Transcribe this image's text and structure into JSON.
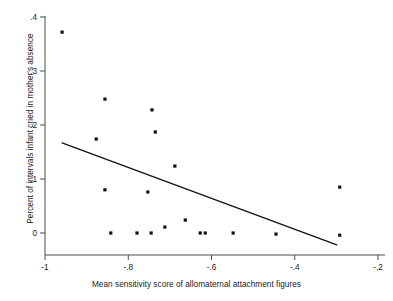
{
  "chart_data": {
    "type": "scatter",
    "title": "",
    "subtitle": "",
    "xlabel": "Mean sensitivity score of allomaternal attachment figures",
    "ylabel": "Percent of intervals infant cried in mother's absence",
    "xlim": [
      -1.03,
      -0.19
    ],
    "ylim": [
      -0.035,
      0.405
    ],
    "xticks": [
      -1,
      -0.8,
      -0.6,
      -0.4,
      -0.2
    ],
    "xticklabels": [
      "-1",
      "-.8",
      "-.6",
      "-.4",
      "-.2"
    ],
    "yticks": [
      0,
      0.1,
      0.2,
      0.3,
      0.4
    ],
    "yticklabels": [
      "0",
      ".1",
      ".2",
      ".3",
      ".4"
    ],
    "grid": false,
    "legend": "none",
    "marker": "filled-square",
    "marker_color": "#111111",
    "points": [
      {
        "x": -0.959,
        "y": 0.372
      },
      {
        "x": -0.877,
        "y": 0.174
      },
      {
        "x": -0.856,
        "y": 0.248
      },
      {
        "x": -0.856,
        "y": 0.08
      },
      {
        "x": -0.753,
        "y": 0.076
      },
      {
        "x": -0.743,
        "y": 0.228
      },
      {
        "x": -0.735,
        "y": 0.187
      },
      {
        "x": -0.688,
        "y": 0.124
      },
      {
        "x": -0.663,
        "y": 0.024
      },
      {
        "x": -0.712,
        "y": 0.011
      },
      {
        "x": -0.842,
        "y": 0.0
      },
      {
        "x": -0.779,
        "y": 0.0
      },
      {
        "x": -0.745,
        "y": 0.0
      },
      {
        "x": -0.627,
        "y": 0.0
      },
      {
        "x": -0.615,
        "y": 0.0
      },
      {
        "x": -0.548,
        "y": 0.0
      },
      {
        "x": -0.445,
        "y": -0.002
      },
      {
        "x": -0.292,
        "y": 0.085
      },
      {
        "x": -0.292,
        "y": -0.004
      }
    ],
    "fit_line": {
      "label": "linear-fit",
      "x0": -0.959,
      "y0": 0.167,
      "x1": -0.299,
      "y1": -0.022,
      "color": "#111111"
    }
  }
}
